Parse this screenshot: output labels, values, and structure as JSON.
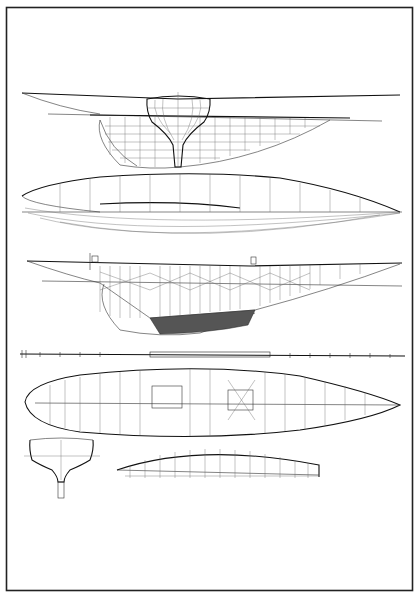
{
  "document": {
    "type": "naval architecture plan sheet",
    "subject": "sailing yacht hull drawings"
  },
  "drawings": [
    {
      "id": "lines-profile",
      "label": "Lines plan — profile with body plan sections"
    },
    {
      "id": "half-breadth",
      "label": "Half-breadth plan"
    },
    {
      "id": "construction-profile",
      "label": "Construction profile with diagonal strapping and ballast keel"
    },
    {
      "id": "frame-scale",
      "label": "Frame spacing strip"
    },
    {
      "id": "deck-plan",
      "label": "Deck framing plan"
    },
    {
      "id": "midship-section",
      "label": "Midship section"
    },
    {
      "id": "deck-detail",
      "label": "Deckhouse / hatch framing detail"
    }
  ],
  "colors": {
    "ink": "#222222",
    "paper": "#ffffff"
  }
}
